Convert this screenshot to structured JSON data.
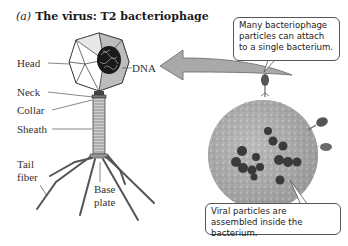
{
  "figure": {
    "part_label": "(a)",
    "title": "The virus: T2 bacteriophage"
  },
  "labels": {
    "head": "Head",
    "dna": "DNA",
    "neck": "Neck",
    "collar": "Collar",
    "sheath": "Sheath",
    "tail_fiber_line1": "Tail",
    "tail_fiber_line2": "fiber",
    "base_plate_line1": "Base",
    "base_plate_line2": "plate"
  },
  "callouts": {
    "top": "Many bacteriophage particles can attach to a single bacterium.",
    "bottom": "Viral particles are assembled inside the bacterium."
  },
  "colors": {
    "arrow_fill": "#a9a9a9",
    "bacterium_fill": "#9a9a9a",
    "viral_particle": "#3a3a3a",
    "line": "#555555"
  }
}
